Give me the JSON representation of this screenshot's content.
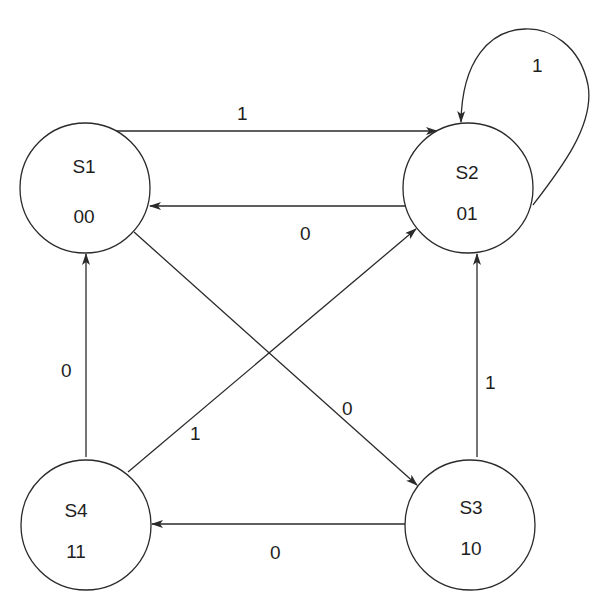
{
  "diagram": {
    "type": "state-machine",
    "stroke_color": "#2a2a2a",
    "states": [
      {
        "id": "S1",
        "name": "S1",
        "code": "00",
        "cx": 85,
        "cy": 188,
        "r": 65
      },
      {
        "id": "S2",
        "name": "S2",
        "code": "01",
        "cx": 468,
        "cy": 188,
        "r": 65
      },
      {
        "id": "S3",
        "name": "S3",
        "code": "10",
        "cx": 470,
        "cy": 525,
        "r": 65
      },
      {
        "id": "S4",
        "name": "S4",
        "code": "11",
        "cx": 86,
        "cy": 525,
        "r": 65
      }
    ],
    "transitions": [
      {
        "from": "S1",
        "to": "S2",
        "input": "1"
      },
      {
        "from": "S2",
        "to": "S1",
        "input": "0"
      },
      {
        "from": "S2",
        "to": "S2",
        "input": "1"
      },
      {
        "from": "S1",
        "to": "S3",
        "input": "0"
      },
      {
        "from": "S4",
        "to": "S2",
        "input": "1"
      },
      {
        "from": "S4",
        "to": "S1",
        "input": "0"
      },
      {
        "from": "S3",
        "to": "S2",
        "input": "1"
      },
      {
        "from": "S3",
        "to": "S4",
        "input": "0"
      }
    ]
  }
}
